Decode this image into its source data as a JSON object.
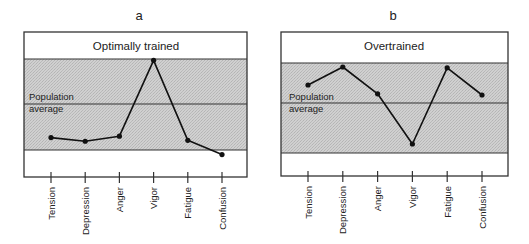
{
  "chart_data": [
    {
      "type": "line",
      "panel_letter": "a",
      "title": "Optimally trained",
      "reference_label": [
        "Population",
        "average"
      ],
      "categories": [
        "Tension",
        "Depression",
        "Anger",
        "Vigor",
        "Fatigue",
        "Confusion"
      ],
      "values": [
        -0.73,
        -0.81,
        -0.7,
        0.97,
        -0.79,
        -1.1
      ],
      "value_units": "relative to population average (shaded band = ±1)",
      "band": [
        -1,
        1
      ],
      "ylim": [
        -1.6,
        1.6
      ],
      "xlabel": "",
      "ylabel": "",
      "grid": false,
      "legend": null
    },
    {
      "type": "line",
      "panel_letter": "b",
      "title": "Overtrained",
      "reference_label": [
        "Population",
        "average"
      ],
      "categories": [
        "Tension",
        "Depression",
        "Anger",
        "Vigor",
        "Fatigue",
        "Confusion"
      ],
      "values": [
        0.45,
        0.9,
        0.23,
        -0.82,
        0.88,
        0.2
      ],
      "value_units": "relative to population average (shaded band = ±1)",
      "band": [
        -1,
        1
      ],
      "ylim": [
        -1.6,
        1.6
      ],
      "xlabel": "",
      "ylabel": "",
      "grid": false,
      "legend": null
    }
  ],
  "colors": {
    "band_fill": "#c9c9c9",
    "line": "#111111",
    "frame": "#333333"
  }
}
